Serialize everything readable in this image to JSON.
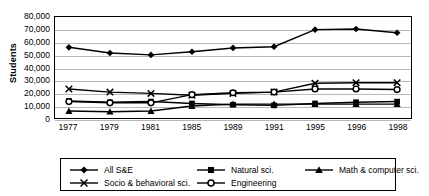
{
  "axis": {
    "y_title": "Students",
    "y_ticks": [
      "80,000",
      "70,000",
      "60,000",
      "50,000",
      "40,000",
      "30,000",
      "20,000",
      "10,000",
      "0"
    ],
    "x_ticks": [
      "1977",
      "1979",
      "1981",
      "1985",
      "1989",
      "1991",
      "1995",
      "1996",
      "1998"
    ]
  },
  "legend": {
    "items": [
      {
        "label": "All S&E",
        "marker": "diamond-marker"
      },
      {
        "label": "Natural sci.",
        "marker": "square-marker"
      },
      {
        "label": "Math & computer sci.",
        "marker": "triangle-marker"
      },
      {
        "label": "Socio & behavioral sci.",
        "marker": "x-marker"
      },
      {
        "label": "Engineering",
        "marker": "open-circle-marker"
      }
    ]
  },
  "chart_data": {
    "type": "line",
    "title": "",
    "xlabel": "",
    "ylabel": "Students",
    "ylim": [
      0,
      80000
    ],
    "ytick_step": 10000,
    "grid": true,
    "legend_position": "bottom",
    "categories": [
      "1977",
      "1979",
      "1981",
      "1985",
      "1989",
      "1991",
      "1995",
      "1996",
      "1998"
    ],
    "series": [
      {
        "name": "All S&E",
        "marker": "diamond",
        "values": [
          56000,
          51500,
          50000,
          52500,
          55500,
          56500,
          70000,
          70500,
          67500
        ]
      },
      {
        "name": "Natural sci.",
        "marker": "square",
        "values": [
          13500,
          12500,
          13000,
          11500,
          10500,
          10000,
          11500,
          12500,
          13000
        ]
      },
      {
        "name": "Math & computer sci.",
        "marker": "triangle",
        "values": [
          5500,
          5000,
          5500,
          9500,
          11000,
          11000,
          11000,
          11000,
          11000
        ]
      },
      {
        "name": "Socio & behavioral sci.",
        "marker": "x",
        "values": [
          23000,
          20500,
          19500,
          18000,
          19500,
          20500,
          27500,
          28000,
          28000
        ]
      },
      {
        "name": "Engineering",
        "marker": "open-circle",
        "values": [
          13000,
          12000,
          12000,
          18500,
          20000,
          20500,
          23000,
          23000,
          22500
        ]
      }
    ]
  },
  "colors": {
    "line": "#000000",
    "grid": "#b8b8b8",
    "background": "#ffffff"
  }
}
